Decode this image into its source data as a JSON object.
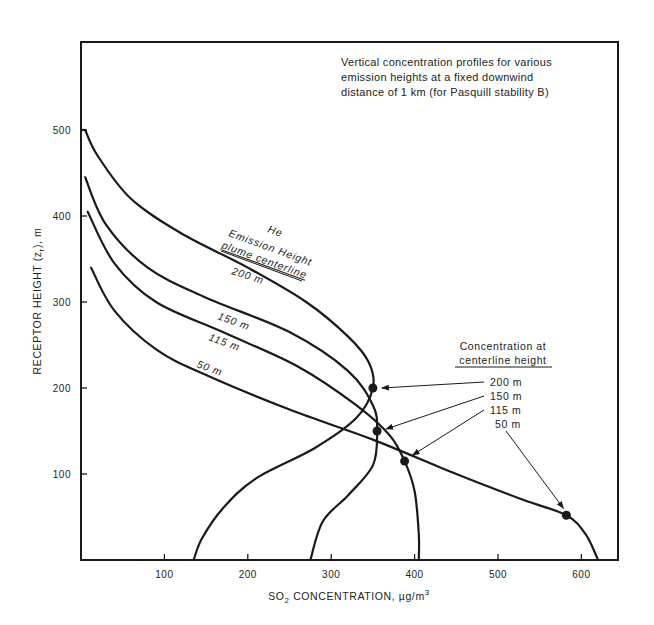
{
  "chart_data": {
    "type": "line",
    "title_lines": [
      "Vertical concentration profiles for various",
      "emission heights at a fixed downwind",
      "distance of 1 km (for Pasquill stability B)"
    ],
    "xlabel": "SO2 CONCENTRATION, µg/m3",
    "xlabel_parts": {
      "pre": "SO",
      "sub": "2",
      "mid": " CONCENTRATION, µg/m",
      "sup": "3"
    },
    "ylabel": "RECEPTOR HEIGHT (zr), m",
    "ylabel_parts": {
      "pre": "RECEPTOR HEIGHT (z",
      "sub": "r",
      "post": "), m"
    },
    "xlim": [
      0,
      645
    ],
    "ylim": [
      0,
      600
    ],
    "xticks": [
      100,
      200,
      300,
      400,
      500,
      600
    ],
    "yticks": [
      100,
      200,
      300,
      400,
      500
    ],
    "grid": false,
    "series_group_label": [
      "He",
      "Emission Height",
      "plume centerline"
    ],
    "series": [
      {
        "name": "200 m",
        "emission_height": 200,
        "points": [
          [
            5,
            500
          ],
          [
            20,
            470
          ],
          [
            60,
            420
          ],
          [
            120,
            380
          ],
          [
            200,
            340
          ],
          [
            270,
            300
          ],
          [
            320,
            260
          ],
          [
            345,
            230
          ],
          [
            350,
            200
          ],
          [
            330,
            165
          ],
          [
            280,
            130
          ],
          [
            210,
            95
          ],
          [
            170,
            60
          ],
          [
            145,
            25
          ],
          [
            135,
            0
          ]
        ],
        "centerline_point": [
          350,
          200
        ]
      },
      {
        "name": "150 m",
        "emission_height": 150,
        "points": [
          [
            5,
            445
          ],
          [
            30,
            390
          ],
          [
            80,
            340
          ],
          [
            150,
            305
          ],
          [
            250,
            265
          ],
          [
            320,
            220
          ],
          [
            350,
            180
          ],
          [
            355,
            150
          ],
          [
            350,
            110
          ],
          [
            320,
            75
          ],
          [
            290,
            45
          ],
          [
            275,
            0
          ]
        ],
        "centerline_point": [
          355,
          150
        ]
      },
      {
        "name": "115 m",
        "emission_height": 115,
        "points": [
          [
            8,
            405
          ],
          [
            40,
            345
          ],
          [
            90,
            300
          ],
          [
            170,
            265
          ],
          [
            260,
            225
          ],
          [
            330,
            180
          ],
          [
            370,
            145
          ],
          [
            388,
            115
          ],
          [
            400,
            80
          ],
          [
            405,
            30
          ],
          [
            405,
            0
          ]
        ],
        "centerline_point": [
          388,
          115
        ]
      },
      {
        "name": "50 m",
        "emission_height": 50,
        "points": [
          [
            12,
            340
          ],
          [
            40,
            290
          ],
          [
            90,
            245
          ],
          [
            150,
            215
          ],
          [
            250,
            175
          ],
          [
            350,
            140
          ],
          [
            450,
            100
          ],
          [
            530,
            70
          ],
          [
            582,
            52
          ],
          [
            605,
            30
          ],
          [
            620,
            0
          ]
        ],
        "centerline_point": [
          582,
          52
        ]
      }
    ],
    "annotations": {
      "legend_title_lines": [
        "Concentration at",
        "centerline height"
      ],
      "legend_items": [
        "200 m",
        "150 m",
        "115 m",
        "50 m"
      ]
    }
  }
}
